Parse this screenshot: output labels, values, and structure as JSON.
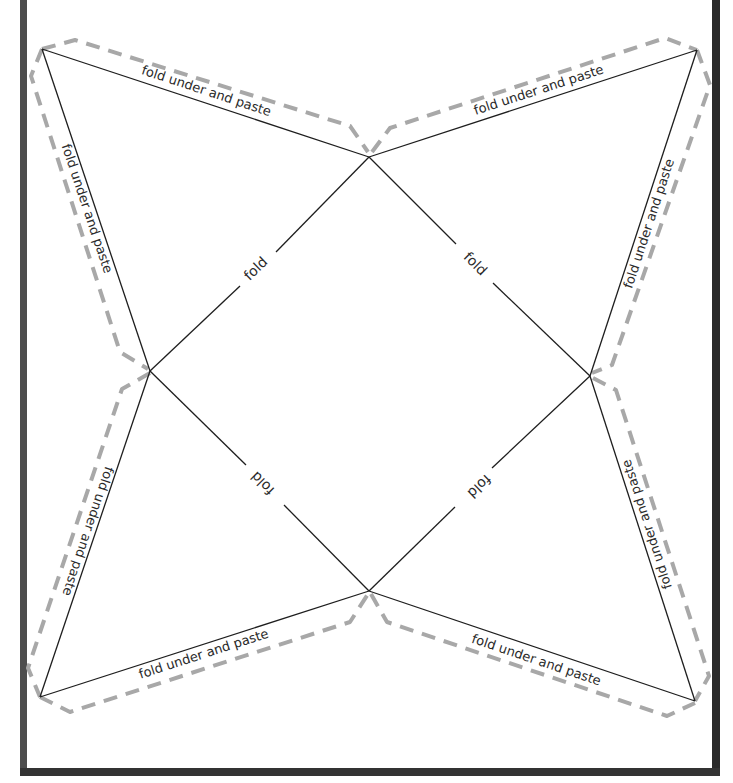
{
  "template": {
    "type": "square pyramid net / printable craft template",
    "background": "#ffffff",
    "frame_color": "#333333",
    "cut_line_color": "#a8a8a8",
    "fold_line_color": "#1e1e1e"
  },
  "flap_labels": {
    "top_left": "fold under and paste",
    "top_right": "fold under and paste",
    "left_upper": "fold under and paste",
    "left_lower": "fold under and paste",
    "right_upper": "fold under and paste",
    "right_lower": "fold under and paste",
    "bottom_left": "fold under and paste",
    "bottom_right": "fold under and paste"
  },
  "fold_labels": {
    "upper_left": "fold",
    "upper_right": "fold",
    "lower_left": "fold",
    "lower_right": "fold"
  }
}
